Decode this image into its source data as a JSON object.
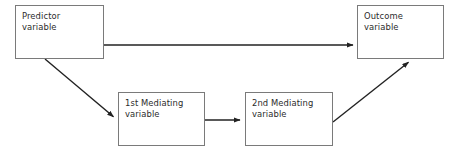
{
  "diagram": {
    "type": "flow-diagram",
    "background_color": "#ffffff",
    "box_border_color": "#7a7a7a",
    "arrow_color": "#222222",
    "text_color": "#2b2b2b",
    "nodes": [
      {
        "id": "predictor",
        "label": "Predictor\nvariable",
        "line1": "Predictor",
        "line2": "variable",
        "x": 15,
        "y": 5,
        "width": 89,
        "height": 54
      },
      {
        "id": "mediator1",
        "label": "1st Mediating\nvariable",
        "line1": "1st Mediating",
        "line2": "variable",
        "x": 118,
        "y": 92,
        "width": 87,
        "height": 54
      },
      {
        "id": "mediator2",
        "label": "2nd Mediating\nvariable",
        "line1": "2nd Mediating",
        "line2": "variable",
        "x": 245,
        "y": 92,
        "width": 88,
        "height": 54
      },
      {
        "id": "outcome",
        "label": "Outcome\nvariable",
        "line1": "Outcome",
        "line2": "variable",
        "x": 357,
        "y": 5,
        "width": 87,
        "height": 54
      }
    ],
    "arrows": [
      {
        "id": "predictor-to-outcome",
        "from": "predictor",
        "to": "outcome",
        "x1": 104,
        "y1": 45,
        "x2": 356,
        "y2": 45,
        "style": "straight"
      },
      {
        "id": "predictor-to-mediator1",
        "from": "predictor",
        "to": "mediator1",
        "x1": 45,
        "y1": 59,
        "x2": 116,
        "y2": 119,
        "style": "diagonal"
      },
      {
        "id": "mediator1-to-mediator2",
        "from": "mediator1",
        "to": "mediator2",
        "x1": 205,
        "y1": 120,
        "x2": 243,
        "y2": 120,
        "style": "straight"
      },
      {
        "id": "mediator2-to-outcome",
        "from": "mediator2",
        "to": "outcome",
        "x1": 333,
        "y1": 122,
        "x2": 411,
        "y2": 60,
        "style": "diagonal"
      }
    ]
  }
}
